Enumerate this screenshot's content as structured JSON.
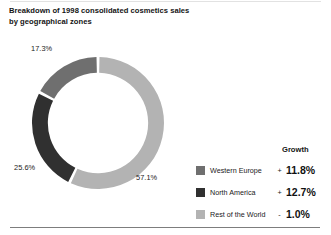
{
  "title": {
    "line1": "Breakdown of 1998 consolidated cosmetics sales",
    "line2": "by geographical zones"
  },
  "legend": {
    "growth_header": "Growth",
    "rows": [
      {
        "label": "Western Europe",
        "sign": "+",
        "growth": "11.8%",
        "color": "#6f6f6f"
      },
      {
        "label": "North America",
        "sign": "+",
        "growth": "12.7%",
        "color": "#303030"
      },
      {
        "label": "Rest of the World",
        "sign": "-",
        "growth": "1.0%",
        "color": "#b3b3b3"
      }
    ]
  },
  "slice_labels": {
    "western_europe": "17.3%",
    "north_america": "25.6%",
    "rest_of_world": "57.1%"
  },
  "chart_data": {
    "type": "pie",
    "variant": "donut",
    "title": "Breakdown of 1998 consolidated cosmetics sales by geographical zones",
    "categories": [
      "Rest of the World",
      "North America",
      "Western Europe"
    ],
    "values": [
      57.1,
      25.6,
      17.3
    ],
    "value_labels": [
      "57.1%",
      "25.6%",
      "17.3%"
    ],
    "colors": [
      "#b3b3b3",
      "#303030",
      "#6f6f6f"
    ],
    "units": "percent",
    "start_angle_deg": 0,
    "direction": "clockwise",
    "inner_radius_ratio": 0.76,
    "gap_deg": 2.6,
    "legend_position": "right",
    "grid": false,
    "series": [
      {
        "name": "Share of 1998 consolidated cosmetics sales",
        "values": [
          57.1,
          25.6,
          17.3
        ]
      },
      {
        "name": "Growth",
        "values": [
          -1.0,
          12.7,
          11.8
        ],
        "labels": [
          "- 1.0%",
          "+ 12.7%",
          "+ 11.8%"
        ]
      }
    ]
  }
}
